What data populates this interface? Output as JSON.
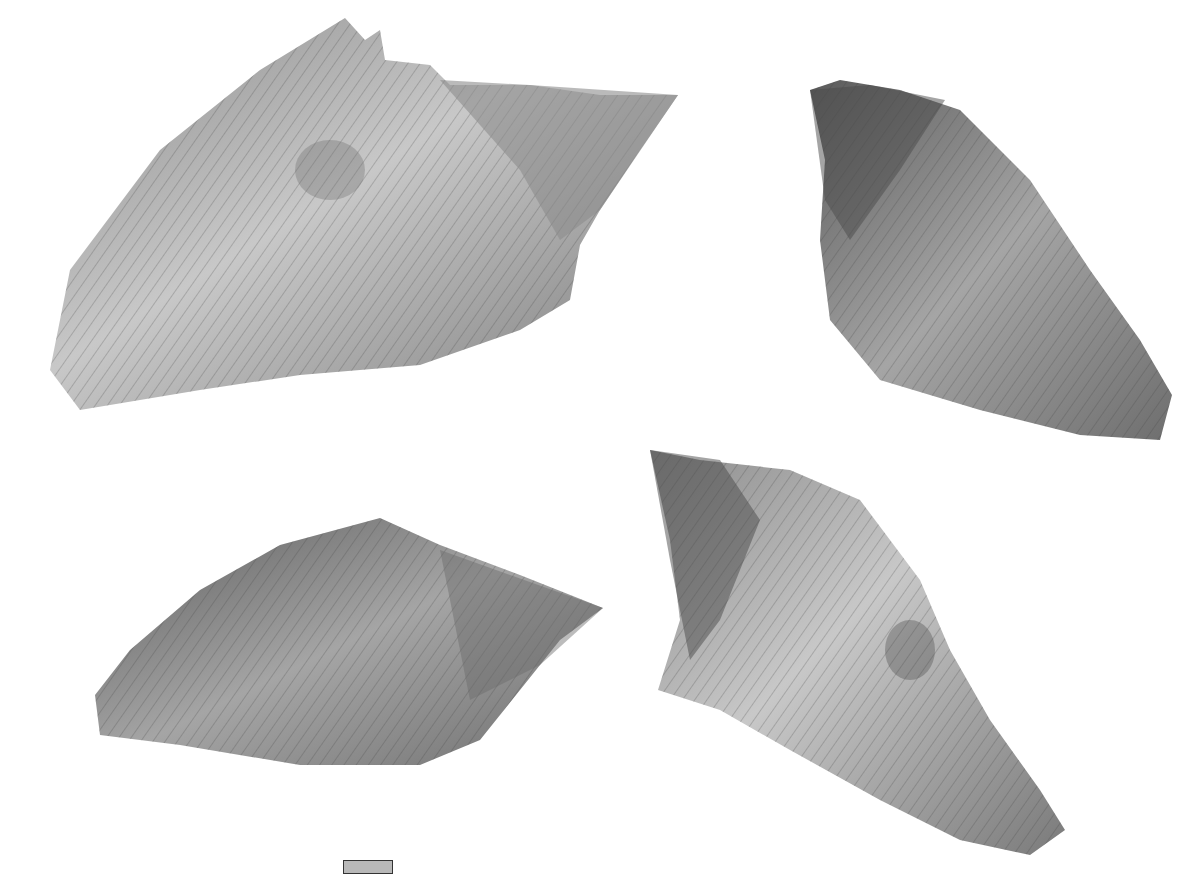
{
  "plate": {
    "background": "#ffffff",
    "specimens": [
      {
        "id": "specimen-1",
        "view": "apertural",
        "position": "top-left"
      },
      {
        "id": "specimen-2",
        "view": "abapertural",
        "position": "top-right"
      },
      {
        "id": "specimen-3",
        "view": "lateral",
        "position": "bottom-left"
      },
      {
        "id": "specimen-4",
        "view": "abapertural",
        "position": "bottom-right"
      }
    ],
    "colors": {
      "shell_light": "#c9c9c9",
      "shell_mid": "#9a9a9a",
      "shell_dark": "#555555"
    }
  }
}
